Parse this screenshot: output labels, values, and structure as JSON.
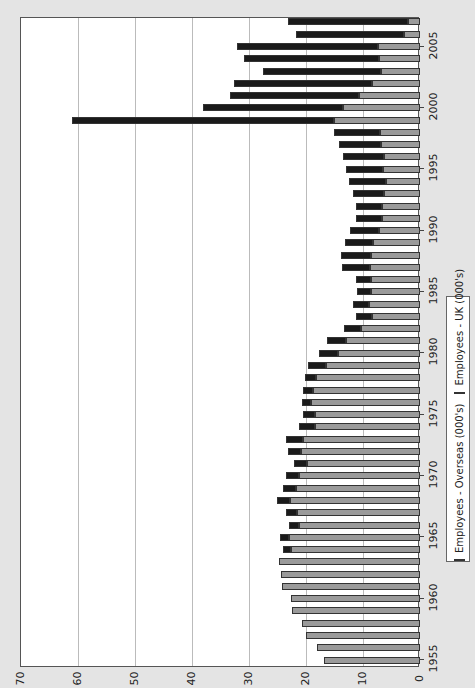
{
  "chart_data": {
    "type": "bar",
    "orientation": "stacked horizontal (rendered rotated 90° CCW)",
    "title": "",
    "xlabel": "",
    "ylabel": "",
    "ylim": [
      0,
      70
    ],
    "value_ticks": [
      "0",
      "10",
      "20",
      "30",
      "40",
      "50",
      "60",
      "70"
    ],
    "year_ticks": [
      "1955",
      "1960",
      "1965",
      "1970",
      "1975",
      "1980",
      "1985",
      "1990",
      "1995",
      "2000",
      "2005"
    ],
    "grid": true,
    "legend_position": "right (bottom after rotation)",
    "legend": [
      "Employees - Overseas (000's)",
      "Employees - UK (000's)"
    ],
    "colors": {
      "overseas": "#1a1a1a",
      "uk": "#9a9a9a"
    },
    "categories": [
      "1955",
      "1956",
      "1957",
      "1958",
      "1959",
      "1960",
      "1961",
      "1962",
      "1963",
      "1964",
      "1965",
      "1966",
      "1967",
      "1968",
      "1969",
      "1970",
      "1971",
      "1972",
      "1973",
      "1974",
      "1975",
      "1976",
      "1977",
      "1978",
      "1979",
      "1980",
      "1981",
      "1982",
      "1983",
      "1984",
      "1985",
      "1986",
      "1987",
      "1988",
      "1989",
      "1990",
      "1991",
      "1992",
      "1993",
      "1994",
      "1995",
      "1996",
      "1997",
      "1998",
      "1999",
      "2000",
      "2001",
      "2002",
      "2003",
      "2004",
      "2005",
      "2006",
      "2007"
    ],
    "series": [
      {
        "name": "Employees - UK (000's)",
        "values": [
          16.8,
          18.1,
          20.0,
          20.7,
          22.4,
          22.6,
          24.2,
          24.4,
          24.7,
          22.6,
          23.0,
          21.2,
          21.6,
          22.8,
          21.8,
          21.2,
          19.8,
          20.9,
          20.5,
          18.4,
          18.4,
          19.1,
          18.8,
          18.2,
          16.5,
          14.4,
          13.0,
          10.4,
          8.4,
          9.0,
          8.6,
          8.6,
          8.8,
          8.6,
          8.2,
          7.2,
          6.7,
          6.7,
          6.3,
          6.0,
          6.5,
          6.3,
          6.8,
          7.0,
          15.1,
          13.5,
          10.7,
          8.4,
          6.8,
          7.2,
          7.4,
          2.8,
          2.1
        ]
      },
      {
        "name": "Employees - Overseas (000's)",
        "values": [
          0,
          0,
          0,
          0,
          0,
          0,
          0,
          0,
          0,
          1.4,
          1.6,
          1.8,
          1.9,
          2.3,
          2.2,
          2.3,
          2.3,
          2.3,
          3.0,
          2.8,
          2.1,
          1.6,
          1.7,
          2.0,
          3.1,
          3.3,
          3.3,
          2.9,
          2.8,
          2.8,
          2.5,
          2.6,
          4.9,
          5.3,
          5.0,
          5.1,
          4.5,
          4.5,
          5.5,
          6.5,
          6.5,
          7.2,
          7.4,
          8.1,
          46.0,
          24.6,
          22.6,
          24.2,
          20.7,
          23.7,
          24.7,
          19.0,
          21.1
        ]
      }
    ]
  },
  "axis": {
    "value_labels": [
      "0",
      "10",
      "20",
      "30",
      "40",
      "50",
      "60",
      "70"
    ],
    "year_labels": [
      "1955",
      "1960",
      "1965",
      "1970",
      "1975",
      "1980",
      "1985",
      "1990",
      "1995",
      "2000",
      "2005"
    ]
  },
  "legend": {
    "overseas_label": "Employees - Overseas (000's)",
    "uk_label": "Employees - UK (000's)"
  }
}
